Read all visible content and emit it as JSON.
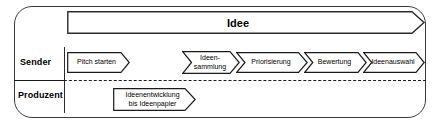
{
  "diagram": {
    "title_banner": {
      "label": "Idee"
    },
    "lanes": [
      {
        "id": "sender",
        "label": "Sender"
      },
      {
        "id": "produzent",
        "label": "Produzent"
      }
    ],
    "sender_steps": [
      {
        "id": "pitch-starten",
        "lines": [
          "Pitch starten"
        ]
      },
      {
        "id": "ideensammlung",
        "lines": [
          "Ideen-",
          "sammlung"
        ]
      },
      {
        "id": "priorisierung",
        "lines": [
          "Priorisierung"
        ]
      },
      {
        "id": "bewertung",
        "lines": [
          "Bewertung"
        ]
      },
      {
        "id": "ideenauswahl",
        "lines": [
          "Ideenauswahl"
        ]
      }
    ],
    "produzent_steps": [
      {
        "id": "ideenentwicklung",
        "lines": [
          "Ideenentwicklung",
          "bis Ideenpapier"
        ]
      }
    ],
    "colors": {
      "frame": "#3a3a3a",
      "shape_stroke": "#1a1a1a",
      "text": "#000000",
      "background": "#ffffff"
    }
  }
}
